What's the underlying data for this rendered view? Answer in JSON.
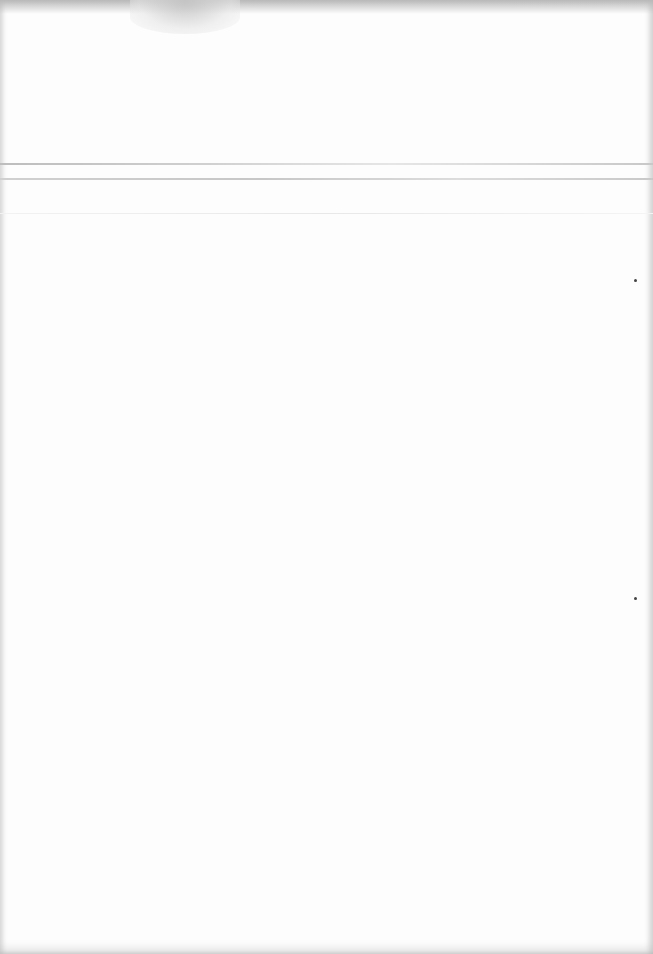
{
  "document": {
    "type": "blank scanned page",
    "text": "",
    "rules": [
      {
        "y": 163
      },
      {
        "y": 178
      },
      {
        "y": 213
      }
    ],
    "marks": [
      {
        "x": 635,
        "y": 280
      },
      {
        "x": 635,
        "y": 598
      }
    ],
    "colors": {
      "paper": "#fdfdfd",
      "edge_shadow": "#bdbdbd",
      "mark": "#444444"
    }
  }
}
